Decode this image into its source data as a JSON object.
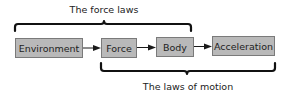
{
  "diagram": {
    "nodes": [
      {
        "id": "environment",
        "label": "Environment"
      },
      {
        "id": "force",
        "label": "Force"
      },
      {
        "id": "body",
        "label": "Body"
      },
      {
        "id": "acceleration",
        "label": "Acceleration"
      }
    ],
    "edges": [
      {
        "from": "environment",
        "to": "force"
      },
      {
        "from": "force",
        "to": "body"
      },
      {
        "from": "body",
        "to": "acceleration"
      }
    ],
    "groups": [
      {
        "id": "force-laws",
        "label": "The force laws",
        "spans": [
          "environment",
          "force",
          "body"
        ],
        "position": "top"
      },
      {
        "id": "laws-of-motion",
        "label": "The laws of motion",
        "spans": [
          "force",
          "body",
          "acceleration"
        ],
        "position": "bottom"
      }
    ],
    "colors": {
      "box_fill": "#b9b9b9",
      "box_stroke": "#7a7a7a",
      "brace": "#111111",
      "text": "#222222"
    }
  }
}
